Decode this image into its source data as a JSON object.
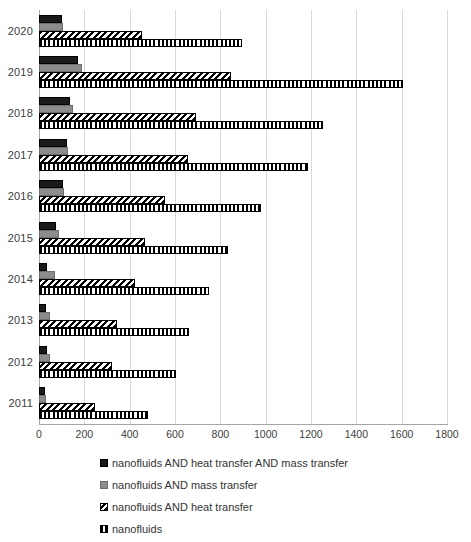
{
  "chart_data": {
    "type": "bar",
    "orientation": "horizontal",
    "title": "",
    "subtitle": "",
    "xlabel": "",
    "ylabel": "",
    "xlim": [
      0,
      1800
    ],
    "ylim": null,
    "grid": true,
    "legend_position": "bottom",
    "xticks": [
      "0",
      "200",
      "400",
      "600",
      "800",
      "1000",
      "1200",
      "1400",
      "1600",
      "1800"
    ],
    "xtick_values": [
      0,
      200,
      400,
      600,
      800,
      1000,
      1200,
      1400,
      1600,
      1800
    ],
    "categories": [
      "2020",
      "2019",
      "2018",
      "2017",
      "2016",
      "2015",
      "2014",
      "2013",
      "2012",
      "2011"
    ],
    "series": [
      {
        "name": "nanofluids AND heat transfer AND mass transfer",
        "style": "solid-black",
        "color": "#1a1a1a",
        "values": [
          101,
          172,
          137,
          123,
          106,
          75,
          34,
          30,
          34,
          25
        ]
      },
      {
        "name": "nanofluids AND mass transfer",
        "style": "solid-gray",
        "color": "#8c8c8c",
        "values": [
          106,
          190,
          150,
          128,
          112,
          89,
          71,
          48,
          48,
          30
        ]
      },
      {
        "name": "nanofluids AND heat transfer",
        "style": "diagonal-hatch",
        "color": "#000000",
        "values": [
          455,
          845,
          693,
          657,
          556,
          468,
          424,
          344,
          322,
          247
        ]
      },
      {
        "name": "nanofluids",
        "style": "vertical-hatch",
        "color": "#000000",
        "values": [
          896,
          1606,
          1253,
          1187,
          980,
          835,
          750,
          662,
          603,
          481
        ]
      }
    ]
  },
  "legend": {
    "items": [
      {
        "label": "nanofluids AND heat transfer AND mass transfer",
        "swatch": "solid-black-swatch"
      },
      {
        "label": "nanofluids AND mass transfer",
        "swatch": "solid-gray-swatch"
      },
      {
        "label": "nanofluids AND heat transfer",
        "swatch": "diagonal-hatch-swatch"
      },
      {
        "label": "nanofluids",
        "swatch": "vertical-hatch-swatch"
      }
    ]
  }
}
